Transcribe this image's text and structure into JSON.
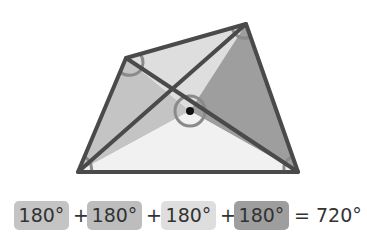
{
  "diagram": {
    "vertices": {
      "top_left": [
        126,
        58
      ],
      "top_right": [
        246,
        24
      ],
      "bottom_right": [
        298,
        172
      ],
      "bottom_left": [
        78,
        172
      ],
      "center": [
        190,
        111
      ]
    },
    "triangles": [
      {
        "name": "left",
        "fill": "#c4c4c4"
      },
      {
        "name": "top",
        "fill": "#dedede"
      },
      {
        "name": "right",
        "fill": "#9e9e9e"
      },
      {
        "name": "bottom",
        "fill": "#f1f1f1"
      }
    ],
    "stroke_color": "#4a4a4a",
    "arc_color": "#8a8a8a",
    "center_dot_color": "#111111"
  },
  "equation": {
    "terms": [
      {
        "label": "180°",
        "fill": "#c4c4c4"
      },
      {
        "label": "180°",
        "fill": "#bdbdbd"
      },
      {
        "label": "180°",
        "fill": "#dedede"
      },
      {
        "label": "180°",
        "fill": "#9e9e9e"
      }
    ],
    "plus": "+",
    "result": "= 720°"
  }
}
